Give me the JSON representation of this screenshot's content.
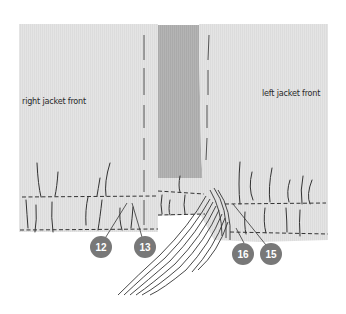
{
  "diagram": {
    "labels": {
      "right_front": "right jacket front",
      "left_front": "left jacket front"
    },
    "callouts": [
      {
        "id": "12",
        "text": "12"
      },
      {
        "id": "13",
        "text": "13"
      },
      {
        "id": "16",
        "text": "16"
      },
      {
        "id": "15",
        "text": "15"
      }
    ],
    "colors": {
      "fabric": "#e4e4e4",
      "strip": "#b2b2b2",
      "badge": "#787878",
      "stitch": "#333333"
    }
  }
}
